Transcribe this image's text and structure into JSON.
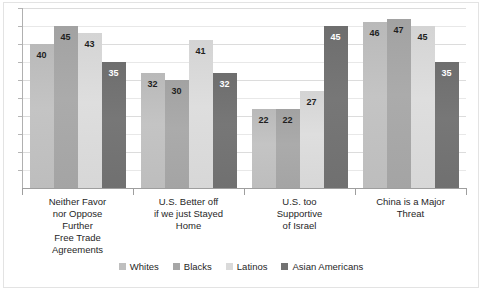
{
  "chart_data": {
    "type": "bar",
    "title": "",
    "subtitle": "",
    "xlabel": "",
    "ylabel": "",
    "ylim": [
      0,
      50
    ],
    "grid": true,
    "gridlines": [
      5,
      10,
      15,
      20,
      25,
      30,
      35,
      40,
      45,
      50
    ],
    "legend_position": "bottom",
    "categories": [
      "Neither Favor nor Oppose Further Free Trade Agreements",
      "U.S. Better off if we just Stayed Home",
      "U.S. too Supportive of Israel",
      "China is a Major Threat"
    ],
    "category_lines": [
      [
        "Neither Favor",
        "nor Oppose",
        "Further",
        "Free Trade",
        "Agreements"
      ],
      [
        "U.S. Better off",
        "if we just Stayed",
        "Home"
      ],
      [
        "U.S. too",
        "Supportive",
        "of Israel"
      ],
      [
        "China is a Major",
        "Threat"
      ]
    ],
    "series": [
      {
        "name": "Whites",
        "color": "#bfbfbf",
        "values": [
          40,
          32,
          22,
          46
        ]
      },
      {
        "name": "Blacks",
        "color": "#a6a6a6",
        "values": [
          45,
          30,
          22,
          47
        ]
      },
      {
        "name": "Latinos",
        "color": "#dadada",
        "values": [
          43,
          41,
          27,
          45
        ]
      },
      {
        "name": "Asian Americans",
        "color": "#727272",
        "values": [
          35,
          32,
          45,
          35
        ]
      }
    ]
  },
  "legend": {
    "items": [
      {
        "label": "Whites"
      },
      {
        "label": "Blacks"
      },
      {
        "label": "Latinos"
      },
      {
        "label": "Asian Americans"
      }
    ]
  }
}
